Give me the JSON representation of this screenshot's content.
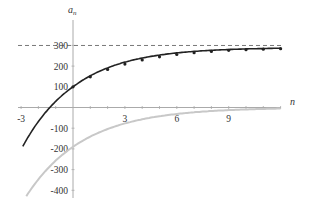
{
  "chart_data": {
    "type": "line",
    "title": "",
    "xlabel": "n",
    "ylabel": "a_n",
    "ylabel_main": "a",
    "ylabel_sub": "n",
    "xlim": [
      -3,
      12
    ],
    "ylim": [
      -420,
      330
    ],
    "grid": false,
    "legend": null,
    "x_ticks": [
      -3,
      3,
      6,
      9
    ],
    "x_tick_labels": [
      "-3",
      "3",
      "6",
      "9"
    ],
    "y_ticks": [
      300,
      200,
      100,
      -100,
      -200,
      -300,
      -400
    ],
    "y_tick_labels": [
      "300",
      "200",
      "100",
      "-100",
      "-200",
      "-300",
      "-400"
    ],
    "asymptote": {
      "y": 290,
      "style": "dashed",
      "color": "#555555"
    },
    "series": [
      {
        "name": "a_n",
        "color": "#222222",
        "style": "solid with point markers",
        "curve_x_range": [
          -2.9,
          12
        ],
        "markers_x": [
          0,
          1,
          2,
          3,
          4,
          5,
          6,
          7,
          8,
          9,
          10,
          11,
          12
        ],
        "markers_y": [
          100,
          148,
          184,
          210,
          230,
          245,
          256,
          265,
          271,
          276,
          279,
          282,
          284
        ]
      },
      {
        "name": "b_n",
        "color": "#c8c8c8",
        "style": "solid",
        "curve_x_range": [
          -2.7,
          12
        ],
        "points_x": [
          -2.7,
          0,
          3,
          6,
          9,
          12
        ],
        "points_y": [
          -400,
          -190,
          -80,
          -34,
          -14,
          -6
        ]
      }
    ]
  }
}
